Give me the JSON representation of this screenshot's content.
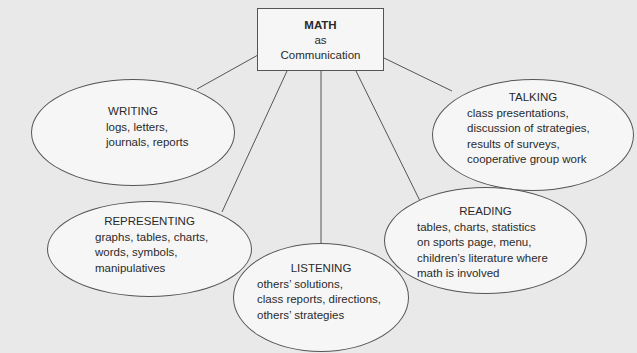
{
  "diagram": {
    "central": {
      "title": "MATH",
      "line2": "as",
      "line3": "Communication"
    },
    "nodes": [
      {
        "id": "writing",
        "title": "WRITING",
        "lines": [
          "logs, letters,",
          "journals, reports"
        ]
      },
      {
        "id": "talking",
        "title": "TALKING",
        "lines": [
          "class presentations,",
          "discussion of strategies,",
          "results of surveys,",
          "cooperative group work"
        ]
      },
      {
        "id": "representing",
        "title": "REPRESENTING",
        "lines": [
          "graphs, tables, charts,",
          "words, symbols,",
          "manipulatives"
        ]
      },
      {
        "id": "reading",
        "title": "READING",
        "lines": [
          "tables, charts, statistics",
          "on sports page, menu,",
          "children’s literature where",
          "math is involved"
        ]
      },
      {
        "id": "listening",
        "title": "LISTENING",
        "lines": [
          "others’ solutions,",
          "class reports, directions,",
          "others’ strategies"
        ]
      }
    ],
    "colors": {
      "background": "#e9e9e9",
      "shape_fill": "#f6f6f6",
      "stroke": "#555555",
      "text": "#2a2a2a"
    }
  }
}
